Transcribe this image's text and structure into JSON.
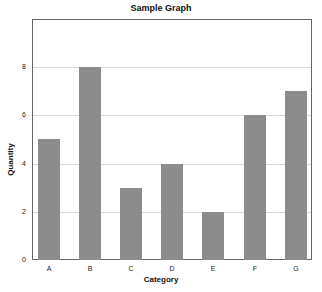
{
  "chart_data": {
    "type": "bar",
    "title": "Sample Graph",
    "xlabel": "Category",
    "ylabel": "Quantity",
    "categories": [
      "A",
      "B",
      "C",
      "D",
      "E",
      "F",
      "G"
    ],
    "values": [
      5,
      8,
      3,
      4,
      2,
      6,
      7
    ],
    "ylim": [
      0,
      10
    ],
    "yticks": [
      0,
      2,
      4,
      6,
      8
    ],
    "grid": true,
    "legend": null,
    "bar_color": "#8c8c8c"
  }
}
